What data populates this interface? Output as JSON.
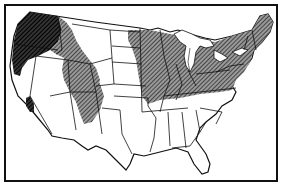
{
  "map": {
    "title": "",
    "region": "Contiguous United States",
    "style": "black-and-white line map with hatched shading",
    "colors": {
      "background": "#ffffff",
      "border": "#111111",
      "hatch": "#222222",
      "dense_shade": "#0a0a0a"
    },
    "shaded_regions": [
      {
        "name": "pacific-northwest",
        "label": "Pacific Northwest (Washington, Oregon west, Idaho north)",
        "density": "dense"
      },
      {
        "name": "northern-rockies",
        "label": "Idaho / western Montana / Wyoming strip",
        "density": "hatched"
      },
      {
        "name": "california-sierra",
        "label": "Northern California Sierra patch",
        "density": "dense"
      },
      {
        "name": "great-basin-east",
        "label": "Utah / western Colorado",
        "density": "hatched"
      },
      {
        "name": "northern-plains-east",
        "label": "Eastern North Dakota / Minnesota",
        "density": "hatched"
      },
      {
        "name": "eastern-us",
        "label": "Midwest, Northeast and Appalachians",
        "density": "hatched"
      }
    ],
    "annotations": []
  }
}
